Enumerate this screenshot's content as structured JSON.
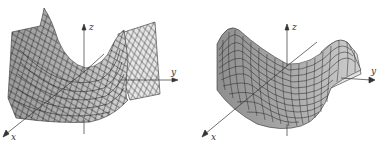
{
  "figures": [
    {
      "id": "left",
      "description": "saddle surface with diamond (rotated) mesh",
      "surface_color": "#a8a8a8",
      "surface_shadow": "#8a8a8a",
      "surface_light": "#e4e4e4",
      "mesh_color": "#2a2a2a",
      "axes": {
        "x": "x",
        "y": "y",
        "z": "z"
      }
    },
    {
      "id": "right",
      "description": "saddle surface with rectangular mesh",
      "surface_color": "#a0a0a0",
      "surface_shadow": "#8c8c8c",
      "surface_light": "#e0e0e0",
      "mesh_color": "#2a2a2a",
      "axes": {
        "x": "x",
        "y": "y",
        "z": "z"
      }
    }
  ],
  "axis_color": "#333333"
}
